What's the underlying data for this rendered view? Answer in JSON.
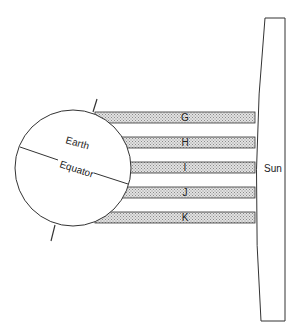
{
  "diagram": {
    "earth": {
      "label": "Earth",
      "equator_label": "Equator"
    },
    "sun": {
      "label": "Sun"
    },
    "bands": [
      {
        "label": "G",
        "y": 112
      },
      {
        "label": "H",
        "y": 137
      },
      {
        "label": "I",
        "y": 162
      },
      {
        "label": "J",
        "y": 187
      },
      {
        "label": "K",
        "y": 212
      }
    ],
    "colors": {
      "stroke": "#333333",
      "band_fill": "#c8c8c8",
      "background": "#ffffff"
    }
  }
}
